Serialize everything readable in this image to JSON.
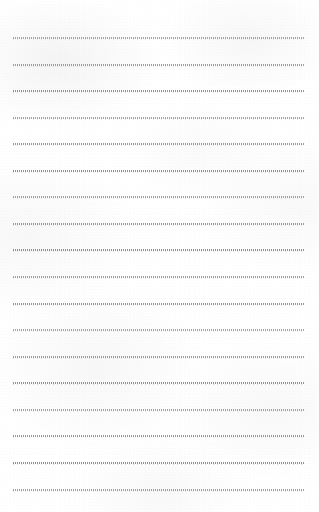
{
  "document": {
    "kind": "lined-notepaper",
    "title": "",
    "written_text": "",
    "page_width": 319,
    "page_height": 512,
    "paper_color": "#fdfdfd",
    "rule_color": "#8f8f92",
    "rule_style": "dotted",
    "rule_count": 18,
    "rule_left_margin": 13,
    "rule_right_margin": 14,
    "rule_first_y": 37,
    "rule_spacing": 26.6,
    "margin_rule": "none",
    "lines": [
      {
        "index": 1,
        "y": 37,
        "text": ""
      },
      {
        "index": 2,
        "y": 64,
        "text": ""
      },
      {
        "index": 3,
        "y": 90,
        "text": ""
      },
      {
        "index": 4,
        "y": 117,
        "text": ""
      },
      {
        "index": 5,
        "y": 143,
        "text": ""
      },
      {
        "index": 6,
        "y": 170,
        "text": ""
      },
      {
        "index": 7,
        "y": 196,
        "text": ""
      },
      {
        "index": 8,
        "y": 223,
        "text": ""
      },
      {
        "index": 9,
        "y": 249,
        "text": ""
      },
      {
        "index": 10,
        "y": 276,
        "text": ""
      },
      {
        "index": 11,
        "y": 303,
        "text": ""
      },
      {
        "index": 12,
        "y": 329,
        "text": ""
      },
      {
        "index": 13,
        "y": 356,
        "text": ""
      },
      {
        "index": 14,
        "y": 382,
        "text": ""
      },
      {
        "index": 15,
        "y": 409,
        "text": ""
      },
      {
        "index": 16,
        "y": 435,
        "text": ""
      },
      {
        "index": 17,
        "y": 462,
        "text": ""
      },
      {
        "index": 18,
        "y": 489,
        "text": ""
      }
    ]
  }
}
